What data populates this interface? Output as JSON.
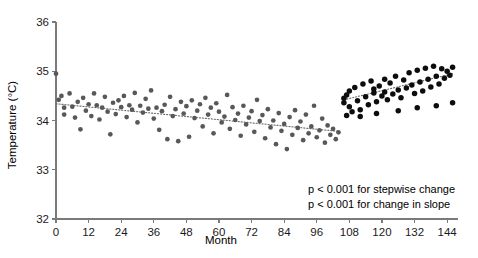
{
  "chart_data": {
    "type": "scatter",
    "title": "",
    "xlabel": "Month",
    "ylabel": "Temperature (°C)",
    "xlim": [
      0,
      148
    ],
    "ylim": [
      32,
      36
    ],
    "xticks": [
      0,
      12,
      24,
      36,
      48,
      60,
      72,
      84,
      96,
      108,
      120,
      132,
      144
    ],
    "xtick_labels": [
      "0",
      "12",
      "24",
      "36",
      "48",
      "60",
      "72",
      "84",
      "96",
      "108",
      "120",
      "132",
      "144"
    ],
    "yticks": [
      32,
      33,
      34,
      35,
      36
    ],
    "ytick_labels": [
      "32",
      "33",
      "34",
      "35",
      "36"
    ],
    "grid": false,
    "legend": null,
    "colors": {
      "segment1_points": "#585858",
      "segment2_points": "#0d0d0d",
      "trend_line": "#6e6e6e",
      "axis": "#7a7a7a",
      "text": "#000000",
      "background": "#ffffff"
    },
    "annotations": [
      "p < 0.001 for stepwise change",
      "p < 0.001 for change in slope"
    ],
    "trend_lines": [
      {
        "name": "pre-intervention segment",
        "x_start": 0,
        "x_end": 104,
        "y_start": 34.34,
        "y_end": 33.78,
        "style": "dotted"
      },
      {
        "name": "post-intervention segment",
        "x_start": 106,
        "x_end": 146,
        "y_start": 34.42,
        "y_end": 34.95,
        "style": "dotted"
      }
    ],
    "series": [
      {
        "name": "Pre-intervention monthly temperature",
        "marker": "circle",
        "color": "#585858",
        "points": [
          [
            0,
            34.95
          ],
          [
            1,
            34.42
          ],
          [
            2,
            34.5
          ],
          [
            3,
            34.26
          ],
          [
            3,
            34.12
          ],
          [
            5,
            34.55
          ],
          [
            6,
            34.28
          ],
          [
            7,
            34.06
          ],
          [
            8,
            34.38
          ],
          [
            9,
            33.82
          ],
          [
            10,
            34.46
          ],
          [
            11,
            34.2
          ],
          [
            12,
            34.33
          ],
          [
            13,
            34.09
          ],
          [
            14,
            34.55
          ],
          [
            15,
            34.31
          ],
          [
            16,
            34.02
          ],
          [
            17,
            34.26
          ],
          [
            18,
            34.48
          ],
          [
            19,
            34.18
          ],
          [
            20,
            33.72
          ],
          [
            21,
            34.36
          ],
          [
            22,
            34.13
          ],
          [
            23,
            34.41
          ],
          [
            24,
            34.27
          ],
          [
            25,
            34.5
          ],
          [
            26,
            34.07
          ],
          [
            27,
            34.31
          ],
          [
            28,
            34.22
          ],
          [
            29,
            34.56
          ],
          [
            30,
            33.96
          ],
          [
            31,
            34.3
          ],
          [
            32,
            34.16
          ],
          [
            33,
            34.44
          ],
          [
            34,
            34.24
          ],
          [
            35,
            34.61
          ],
          [
            36,
            34.04
          ],
          [
            37,
            34.26
          ],
          [
            38,
            33.81
          ],
          [
            39,
            34.19
          ],
          [
            40,
            34.32
          ],
          [
            41,
            33.62
          ],
          [
            42,
            34.48
          ],
          [
            43,
            34.09
          ],
          [
            44,
            34.23
          ],
          [
            45,
            33.58
          ],
          [
            46,
            34.38
          ],
          [
            47,
            34.14
          ],
          [
            48,
            34.29
          ],
          [
            49,
            33.67
          ],
          [
            50,
            34.41
          ],
          [
            51,
            34.05
          ],
          [
            52,
            34.2
          ],
          [
            53,
            34.33
          ],
          [
            54,
            33.88
          ],
          [
            55,
            34.46
          ],
          [
            56,
            34.12
          ],
          [
            57,
            34.26
          ],
          [
            58,
            33.74
          ],
          [
            59,
            34.35
          ],
          [
            60,
            34.18
          ],
          [
            61,
            33.96
          ],
          [
            62,
            34.08
          ],
          [
            63,
            34.52
          ],
          [
            64,
            33.83
          ],
          [
            65,
            34.27
          ],
          [
            66,
            34.01
          ],
          [
            67,
            34.14
          ],
          [
            68,
            33.69
          ],
          [
            69,
            34.3
          ],
          [
            70,
            33.92
          ],
          [
            71,
            34.06
          ],
          [
            72,
            34.19
          ],
          [
            73,
            33.77
          ],
          [
            74,
            34.42
          ],
          [
            75,
            33.99
          ],
          [
            76,
            34.11
          ],
          [
            77,
            33.64
          ],
          [
            78,
            34.23
          ],
          [
            79,
            33.86
          ],
          [
            80,
            34.0
          ],
          [
            81,
            33.52
          ],
          [
            82,
            34.15
          ],
          [
            83,
            33.79
          ],
          [
            84,
            33.93
          ],
          [
            85,
            33.42
          ],
          [
            86,
            34.07
          ],
          [
            87,
            33.71
          ],
          [
            88,
            34.21
          ],
          [
            89,
            33.85
          ],
          [
            90,
            33.98
          ],
          [
            91,
            33.6
          ],
          [
            92,
            34.12
          ],
          [
            93,
            33.74
          ],
          [
            94,
            33.88
          ],
          [
            95,
            34.3
          ],
          [
            96,
            33.66
          ],
          [
            97,
            33.8
          ],
          [
            98,
            34.04
          ],
          [
            99,
            33.55
          ],
          [
            100,
            33.9
          ],
          [
            101,
            33.71
          ],
          [
            102,
            33.83
          ],
          [
            103,
            33.62
          ],
          [
            104,
            33.76
          ]
        ]
      },
      {
        "name": "Post-intervention monthly temperature",
        "marker": "circle",
        "color": "#0d0d0d",
        "points": [
          [
            106,
            34.45
          ],
          [
            106,
            34.36
          ],
          [
            107,
            34.52
          ],
          [
            108,
            34.28
          ],
          [
            108,
            34.6
          ],
          [
            109,
            34.18
          ],
          [
            110,
            34.67
          ],
          [
            111,
            34.4
          ],
          [
            112,
            34.22
          ],
          [
            113,
            34.74
          ],
          [
            114,
            34.48
          ],
          [
            115,
            34.32
          ],
          [
            116,
            34.8
          ],
          [
            117,
            34.56
          ],
          [
            117,
            34.64
          ],
          [
            118,
            34.38
          ],
          [
            119,
            34.7
          ],
          [
            120,
            34.5
          ],
          [
            121,
            34.84
          ],
          [
            121,
            34.58
          ],
          [
            122,
            34.42
          ],
          [
            123,
            34.76
          ],
          [
            124,
            34.54
          ],
          [
            125,
            34.9
          ],
          [
            126,
            34.62
          ],
          [
            127,
            34.46
          ],
          [
            128,
            34.82
          ],
          [
            129,
            34.66
          ],
          [
            130,
            34.97
          ],
          [
            131,
            34.72
          ],
          [
            132,
            34.55
          ],
          [
            133,
            35.02
          ],
          [
            134,
            34.78
          ],
          [
            135,
            34.6
          ],
          [
            136,
            35.06
          ],
          [
            137,
            34.84
          ],
          [
            138,
            34.68
          ],
          [
            139,
            35.1
          ],
          [
            140,
            34.9
          ],
          [
            141,
            34.74
          ],
          [
            142,
            35.05
          ],
          [
            143,
            34.86
          ],
          [
            144,
            35.0
          ],
          [
            145,
            34.92
          ],
          [
            146,
            35.08
          ],
          [
            107,
            34.1
          ],
          [
            112,
            34.08
          ],
          [
            118,
            34.14
          ],
          [
            126,
            34.2
          ],
          [
            133,
            34.26
          ],
          [
            140,
            34.3
          ],
          [
            146,
            34.36
          ]
        ]
      }
    ]
  },
  "xaxis_title": "Month",
  "yaxis_title": "Temperature (°C)",
  "annotation_line_1": "p < 0.001 for stepwise change",
  "annotation_line_2": "p < 0.001 for change in slope"
}
